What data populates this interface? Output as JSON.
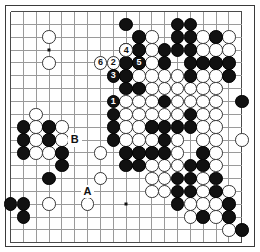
{
  "diagram": {
    "kind": "go-board-diagram",
    "board_size": 19,
    "colors": {
      "background": "#ffffff",
      "grid_line": "#9a9a9a",
      "border": "#3a3a3a",
      "black_stone": "#111111",
      "white_stone": "#ffffff",
      "white_stone_outline": "#333333",
      "label_text": "#111111"
    },
    "geometry": {
      "origin_x": 10.5,
      "origin_y": 11.5,
      "step": 12.85,
      "stone_diameter": 13.6
    },
    "star_points": [
      {
        "col": 4,
        "row": 4
      },
      {
        "col": 10,
        "row": 4
      },
      {
        "col": 16,
        "row": 4
      },
      {
        "col": 4,
        "row": 10
      },
      {
        "col": 10,
        "row": 10
      },
      {
        "col": 16,
        "row": 10
      },
      {
        "col": 4,
        "row": 16
      },
      {
        "col": 10,
        "row": 16
      },
      {
        "col": 16,
        "row": 16
      }
    ],
    "black_stones": [
      {
        "col": 10,
        "row": 2
      },
      {
        "col": 14,
        "row": 2
      },
      {
        "col": 15,
        "row": 2
      },
      {
        "col": 11,
        "row": 3
      },
      {
        "col": 14,
        "row": 3
      },
      {
        "col": 15,
        "row": 3
      },
      {
        "col": 17,
        "row": 3
      },
      {
        "col": 10,
        "row": 4
      },
      {
        "col": 11,
        "row": 4
      },
      {
        "col": 13,
        "row": 4
      },
      {
        "col": 14,
        "row": 4
      },
      {
        "col": 15,
        "row": 4
      },
      {
        "col": 10,
        "row": 5
      },
      {
        "col": 13,
        "row": 5
      },
      {
        "col": 15,
        "row": 5
      },
      {
        "col": 16,
        "row": 5
      },
      {
        "col": 17,
        "row": 5
      },
      {
        "col": 18,
        "row": 5
      },
      {
        "col": 10,
        "row": 6
      },
      {
        "col": 15,
        "row": 6
      },
      {
        "col": 18,
        "row": 6
      },
      {
        "col": 10,
        "row": 7
      },
      {
        "col": 11,
        "row": 7
      },
      {
        "col": 9,
        "row": 8
      },
      {
        "col": 13,
        "row": 8
      },
      {
        "col": 19,
        "row": 8
      },
      {
        "col": 9,
        "row": 9
      },
      {
        "col": 15,
        "row": 9
      },
      {
        "col": 2,
        "row": 10
      },
      {
        "col": 4,
        "row": 10
      },
      {
        "col": 9,
        "row": 10
      },
      {
        "col": 12,
        "row": 10
      },
      {
        "col": 13,
        "row": 10
      },
      {
        "col": 14,
        "row": 10
      },
      {
        "col": 15,
        "row": 10
      },
      {
        "col": 2,
        "row": 11
      },
      {
        "col": 4,
        "row": 11
      },
      {
        "col": 9,
        "row": 11
      },
      {
        "col": 13,
        "row": 11
      },
      {
        "col": 2,
        "row": 12
      },
      {
        "col": 5,
        "row": 12
      },
      {
        "col": 10,
        "row": 12
      },
      {
        "col": 11,
        "row": 12
      },
      {
        "col": 12,
        "row": 12
      },
      {
        "col": 13,
        "row": 12
      },
      {
        "col": 16,
        "row": 12
      },
      {
        "col": 5,
        "row": 13
      },
      {
        "col": 10,
        "row": 13
      },
      {
        "col": 11,
        "row": 13
      },
      {
        "col": 15,
        "row": 13
      },
      {
        "col": 16,
        "row": 13
      },
      {
        "col": 4,
        "row": 14
      },
      {
        "col": 14,
        "row": 14
      },
      {
        "col": 15,
        "row": 14
      },
      {
        "col": 17,
        "row": 14
      },
      {
        "col": 14,
        "row": 15
      },
      {
        "col": 15,
        "row": 15
      },
      {
        "col": 17,
        "row": 15
      },
      {
        "col": 1,
        "row": 16
      },
      {
        "col": 2,
        "row": 16
      },
      {
        "col": 14,
        "row": 16
      },
      {
        "col": 18,
        "row": 16
      },
      {
        "col": 2,
        "row": 17
      },
      {
        "col": 16,
        "row": 17
      },
      {
        "col": 18,
        "row": 17
      },
      {
        "col": 19,
        "row": 18
      }
    ],
    "white_stones": [
      {
        "col": 4,
        "row": 3
      },
      {
        "col": 12,
        "row": 3
      },
      {
        "col": 16,
        "row": 3
      },
      {
        "col": 18,
        "row": 3
      },
      {
        "col": 12,
        "row": 4
      },
      {
        "col": 16,
        "row": 4
      },
      {
        "col": 17,
        "row": 4
      },
      {
        "col": 18,
        "row": 4
      },
      {
        "col": 4,
        "row": 5
      },
      {
        "col": 9,
        "row": 5
      },
      {
        "col": 11,
        "row": 5
      },
      {
        "col": 12,
        "row": 5
      },
      {
        "col": 11,
        "row": 6
      },
      {
        "col": 12,
        "row": 6
      },
      {
        "col": 13,
        "row": 6
      },
      {
        "col": 14,
        "row": 6
      },
      {
        "col": 16,
        "row": 6
      },
      {
        "col": 17,
        "row": 6
      },
      {
        "col": 12,
        "row": 7
      },
      {
        "col": 13,
        "row": 7
      },
      {
        "col": 14,
        "row": 7
      },
      {
        "col": 15,
        "row": 7
      },
      {
        "col": 16,
        "row": 7
      },
      {
        "col": 17,
        "row": 7
      },
      {
        "col": 10,
        "row": 8
      },
      {
        "col": 11,
        "row": 8
      },
      {
        "col": 12,
        "row": 8
      },
      {
        "col": 14,
        "row": 8
      },
      {
        "col": 15,
        "row": 8
      },
      {
        "col": 16,
        "row": 8
      },
      {
        "col": 17,
        "row": 8
      },
      {
        "col": 3,
        "row": 9
      },
      {
        "col": 10,
        "row": 9
      },
      {
        "col": 11,
        "row": 9
      },
      {
        "col": 12,
        "row": 9
      },
      {
        "col": 13,
        "row": 9
      },
      {
        "col": 14,
        "row": 9
      },
      {
        "col": 16,
        "row": 9
      },
      {
        "col": 17,
        "row": 9
      },
      {
        "col": 3,
        "row": 10
      },
      {
        "col": 5,
        "row": 10
      },
      {
        "col": 10,
        "row": 10
      },
      {
        "col": 11,
        "row": 10
      },
      {
        "col": 16,
        "row": 10
      },
      {
        "col": 17,
        "row": 10
      },
      {
        "col": 3,
        "row": 11
      },
      {
        "col": 5,
        "row": 11
      },
      {
        "col": 10,
        "row": 11
      },
      {
        "col": 11,
        "row": 11
      },
      {
        "col": 12,
        "row": 11
      },
      {
        "col": 14,
        "row": 11
      },
      {
        "col": 16,
        "row": 11
      },
      {
        "col": 17,
        "row": 11
      },
      {
        "col": 19,
        "row": 11
      },
      {
        "col": 3,
        "row": 12
      },
      {
        "col": 4,
        "row": 12
      },
      {
        "col": 14,
        "row": 12
      },
      {
        "col": 17,
        "row": 12
      },
      {
        "col": 8,
        "row": 12
      },
      {
        "col": 8,
        "row": 14
      },
      {
        "col": 12,
        "row": 13
      },
      {
        "col": 13,
        "row": 13
      },
      {
        "col": 14,
        "row": 13
      },
      {
        "col": 17,
        "row": 13
      },
      {
        "col": 12,
        "row": 14
      },
      {
        "col": 13,
        "row": 14
      },
      {
        "col": 16,
        "row": 14
      },
      {
        "col": 12,
        "row": 15
      },
      {
        "col": 13,
        "row": 15
      },
      {
        "col": 16,
        "row": 15
      },
      {
        "col": 18,
        "row": 15
      },
      {
        "col": 4,
        "row": 16
      },
      {
        "col": 7,
        "row": 16
      },
      {
        "col": 15,
        "row": 16
      },
      {
        "col": 16,
        "row": 16
      },
      {
        "col": 17,
        "row": 16
      },
      {
        "col": 15,
        "row": 17
      },
      {
        "col": 17,
        "row": 17
      },
      {
        "col": 18,
        "row": 18
      }
    ],
    "numbered_stones": [
      {
        "label": "1",
        "color": "black",
        "col": 9,
        "row": 8
      },
      {
        "label": "2",
        "color": "white",
        "col": 9,
        "row": 5
      },
      {
        "label": "3",
        "color": "black",
        "col": 9,
        "row": 6
      },
      {
        "label": "4",
        "color": "white",
        "col": 10,
        "row": 4
      },
      {
        "label": "5",
        "color": "black",
        "col": 11,
        "row": 5
      },
      {
        "label": "6",
        "color": "white",
        "col": 8,
        "row": 5
      }
    ],
    "point_labels": [
      {
        "label": "A",
        "col": 7,
        "row": 15
      },
      {
        "label": "B",
        "col": 6,
        "row": 11
      }
    ]
  }
}
